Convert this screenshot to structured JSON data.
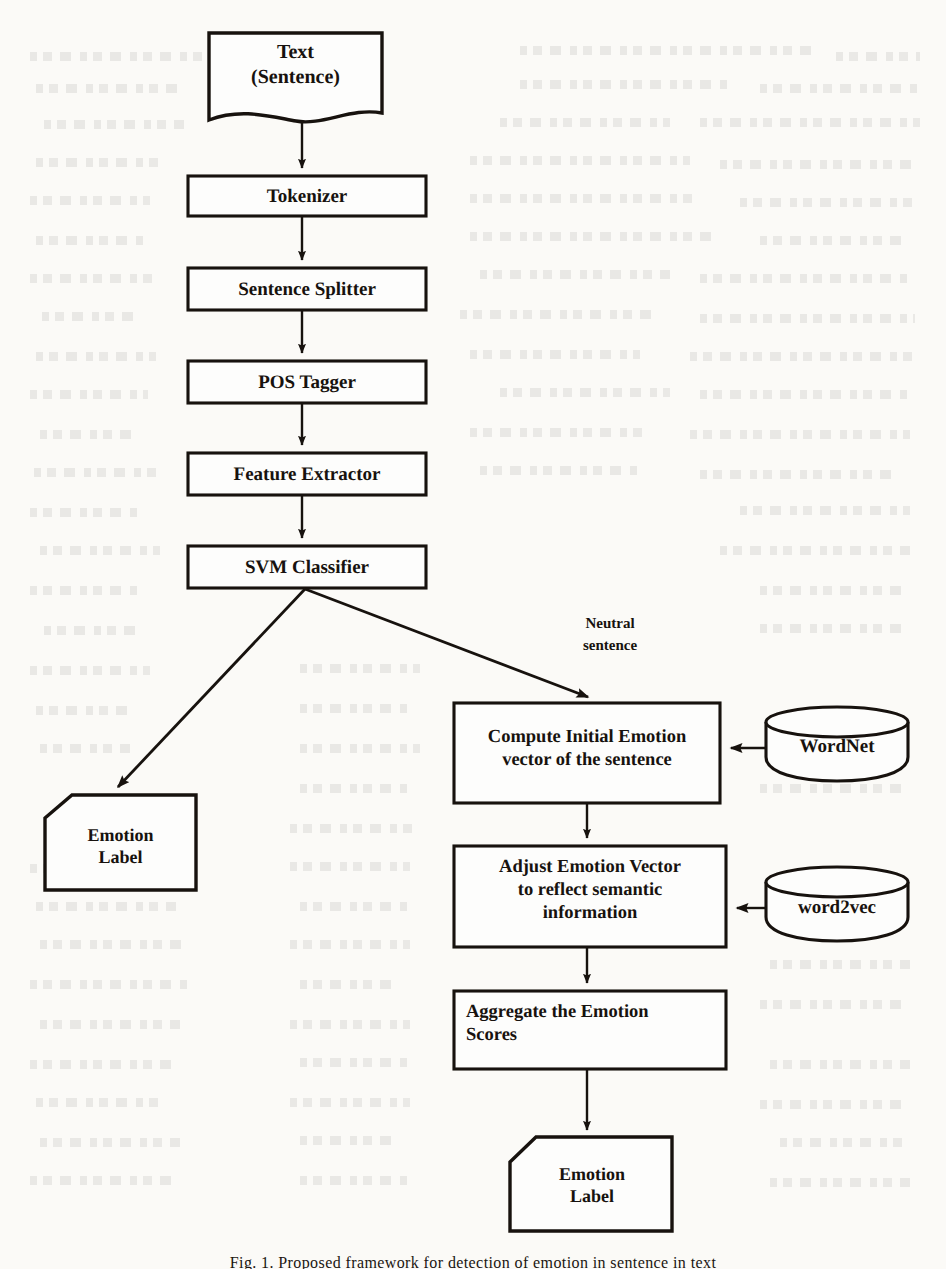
{
  "figure": {
    "caption": "Fig. 1.  Proposed framework for detection of emotion in sentence in text",
    "background_color": "#fbfaf7",
    "ink_color": "#17120e"
  },
  "nodes": {
    "text_input": {
      "line1": "Text",
      "line2": "(Sentence)",
      "shape": "document"
    },
    "tokenizer": {
      "label": "Tokenizer",
      "shape": "process"
    },
    "sentence_splitter": {
      "label": "Sentence Splitter",
      "shape": "process"
    },
    "pos_tagger": {
      "label": "POS Tagger",
      "shape": "process"
    },
    "feature_extractor": {
      "label": "Feature Extractor",
      "shape": "process"
    },
    "svm_classifier": {
      "label": "SVM Classifier",
      "shape": "process"
    },
    "emotion_label_left": {
      "line1": "Emotion",
      "line2": "Label",
      "shape": "pentagon-cut-corner"
    },
    "compute_initial": {
      "line1": "Compute Initial Emotion",
      "line2": "vector of the sentence",
      "shape": "process"
    },
    "adjust_vector": {
      "line1": "Adjust Emotion Vector",
      "line2": "to reflect semantic",
      "line3": "information",
      "shape": "process"
    },
    "aggregate_scores": {
      "line1": "Aggregate the Emotion",
      "line2": "Scores",
      "shape": "process"
    },
    "emotion_label_bottom": {
      "line1": "Emotion",
      "line2": "Label",
      "shape": "pentagon-cut-corner"
    },
    "wordnet": {
      "label": "WordNet",
      "shape": "database-cylinder"
    },
    "word2vec": {
      "label": "word2vec",
      "shape": "database-cylinder"
    }
  },
  "edges": {
    "neutral_branch": {
      "line1": "Neutral",
      "line2": "sentence"
    }
  }
}
